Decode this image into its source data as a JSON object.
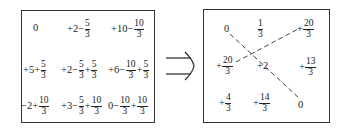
{
  "left_grid": {
    "rows": [
      [
        {
          "parts": [
            {
              "t": "0"
            }
          ]
        },
        {
          "parts": [
            {
              "t": "+2−"
            },
            {
              "n": "5",
              "d": "3"
            }
          ]
        },
        {
          "parts": [
            {
              "t": "+10−"
            },
            {
              "n": "10",
              "d": "3"
            }
          ]
        }
      ],
      [
        {
          "parts": [
            {
              "t": "+5+"
            },
            {
              "n": "5",
              "d": "3"
            }
          ]
        },
        {
          "parts": [
            {
              "t": "+2−"
            },
            {
              "n": "5",
              "d": "3"
            },
            {
              "t": "+"
            },
            {
              "n": "5",
              "d": "3"
            }
          ]
        },
        {
          "parts": [
            {
              "t": "+6−"
            },
            {
              "n": "10",
              "d": "3"
            },
            {
              "t": "+"
            },
            {
              "n": "5",
              "d": "3"
            }
          ]
        }
      ],
      [
        {
          "parts": [
            {
              "t": "−2+"
            },
            {
              "n": "10",
              "d": "3"
            }
          ]
        },
        {
          "parts": [
            {
              "t": "+3−"
            },
            {
              "n": "5",
              "d": "3"
            },
            {
              "t": "+"
            },
            {
              "n": "10",
              "d": "3"
            }
          ]
        },
        {
          "parts": [
            {
              "t": "0−"
            },
            {
              "n": "10",
              "d": "3"
            },
            {
              "t": "+"
            },
            {
              "n": "10",
              "d": "3"
            }
          ]
        }
      ]
    ]
  },
  "arrow": {
    "symbol": "⟹",
    "meaning": "implies"
  },
  "right_grid": {
    "rows": [
      [
        {
          "parts": [
            {
              "t": "0"
            }
          ]
        },
        {
          "parts": [
            {
              "n": "1",
              "d": "3"
            }
          ]
        },
        {
          "parts": [
            {
              "t": "+"
            },
            {
              "n": "20",
              "d": "3"
            }
          ]
        }
      ],
      [
        {
          "parts": [
            {
              "t": "+"
            },
            {
              "n": "20",
              "d": "3"
            }
          ]
        },
        {
          "parts": [
            {
              "t": "+2"
            }
          ]
        },
        {
          "parts": [
            {
              "t": "+"
            },
            {
              "n": "13",
              "d": "3"
            }
          ]
        }
      ],
      [
        {
          "parts": [
            {
              "t": "+"
            },
            {
              "n": "4",
              "d": "3"
            }
          ]
        },
        {
          "parts": [
            {
              "t": "+"
            },
            {
              "n": "14",
              "d": "3"
            }
          ]
        },
        {
          "parts": [
            {
              "t": "0"
            }
          ]
        }
      ]
    ],
    "dashed_lines": [
      {
        "from": "row1-col1",
        "to": "row3-col3"
      },
      {
        "from": "row2-col1",
        "to": "row1-col3"
      }
    ]
  },
  "colors": {
    "stroke": "#333333",
    "text": "#222222",
    "background": "#ffffff"
  }
}
